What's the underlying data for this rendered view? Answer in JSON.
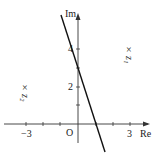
{
  "diagram": {
    "type": "complex-plane",
    "axes": {
      "x_label": "Re",
      "y_label": "Im",
      "origin_label": "O",
      "x_tick_labels": [
        {
          "value": -3,
          "text": "−3"
        },
        {
          "value": 3,
          "text": "3"
        }
      ],
      "y_tick_labels": [
        {
          "value": 2,
          "text": "2"
        },
        {
          "value": 4,
          "text": "4"
        }
      ],
      "x_ticks": [
        -3,
        -2,
        -1,
        1,
        2,
        3
      ],
      "y_ticks": [
        1,
        2,
        3,
        4
      ]
    },
    "points": [
      {
        "label": "z₁",
        "name": "z1",
        "re": 3,
        "im": 4,
        "marker": "×"
      },
      {
        "label": "z₂",
        "name": "z2",
        "re": -3,
        "im": 2,
        "marker": "×"
      }
    ],
    "line": {
      "description": "straight line through (0,3) and (1,0)",
      "y_intercept": 3,
      "x_intercept": 1,
      "slope": -3
    },
    "colors": {
      "ink": "#222222",
      "background": "#ffffff"
    }
  }
}
